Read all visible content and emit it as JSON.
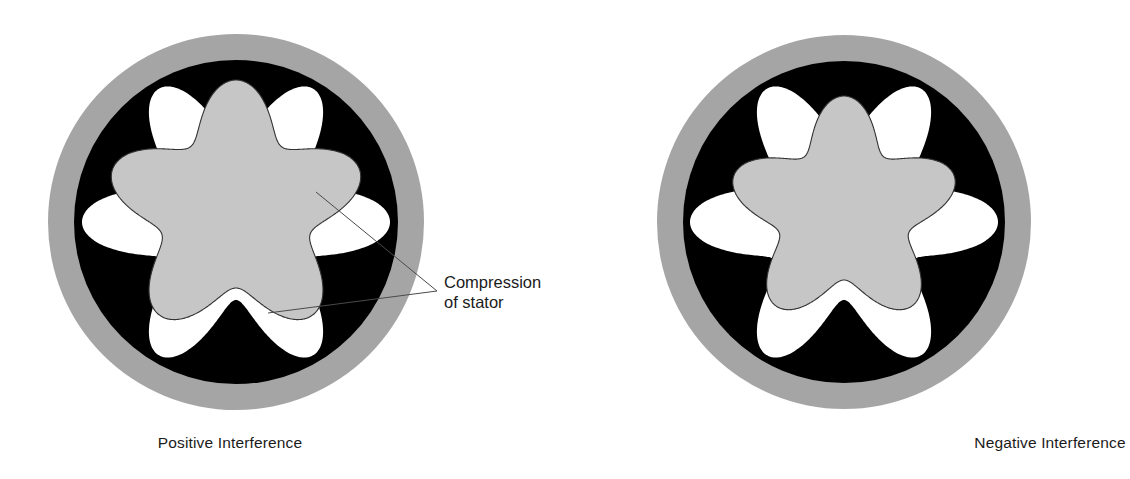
{
  "figure": {
    "background_color": "#ffffff"
  },
  "colors": {
    "stator_housing_ring": "#a5a5a5",
    "stator_elastomer": "#000000",
    "stator_cavity": "#ffffff",
    "rotor_fill": "#c6c6c6",
    "rotor_outline": "#333333",
    "leader_line": "#4a4a4a",
    "text": "#1b1b1b"
  },
  "panels": [
    {
      "id": "positive",
      "caption": "Positive Interference",
      "center": {
        "x": 236,
        "y": 222
      },
      "housing_outer_radius": 188,
      "housing_inner_radius": 162,
      "cavity": {
        "lobes": 6,
        "mean_radius": 116,
        "lobe_amplitude": 38,
        "rotation_deg": 0
      },
      "rotor": {
        "lobes": 5,
        "mean_radius": 104,
        "lobe_amplitude": 26,
        "rotation_deg": -90,
        "offset": {
          "x": 0,
          "y": -12
        },
        "description": "Oversized rotor overlapping the elastomer"
      }
    },
    {
      "id": "negative",
      "caption": "Negative Interference",
      "center": {
        "x": 844,
        "y": 222
      },
      "housing_outer_radius": 187,
      "housing_inner_radius": 161,
      "cavity": {
        "lobes": 6,
        "mean_radius": 116,
        "lobe_amplitude": 38,
        "rotation_deg": 0
      },
      "rotor": {
        "lobes": 5,
        "mean_radius": 92,
        "lobe_amplitude": 24,
        "rotation_deg": -90,
        "offset": {
          "x": 0,
          "y": -10
        },
        "description": "Undersized rotor with running clearance"
      }
    }
  ],
  "callout": {
    "line_1": "Compression",
    "line_2": "of stator",
    "anchor_point": {
      "x": 437,
      "y": 291
    },
    "target_upper": {
      "x": 316,
      "y": 192
    },
    "target_lower": {
      "x": 268,
      "y": 313
    }
  }
}
